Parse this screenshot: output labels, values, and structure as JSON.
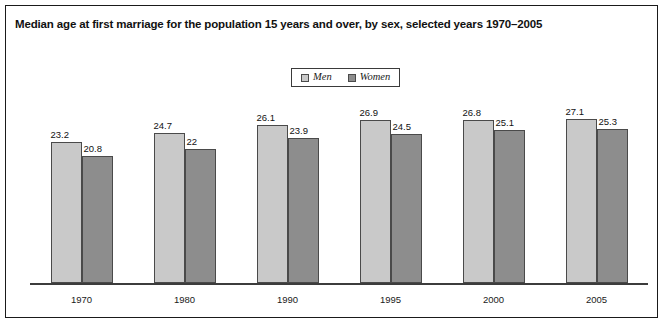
{
  "chart_data": {
    "type": "bar",
    "title": "Median age at first marriage for the population 15 years and over, by sex, selected years 1970–2005",
    "xlabel": "",
    "ylabel": "",
    "categories": [
      "1970",
      "1980",
      "1990",
      "1995",
      "2000",
      "2005"
    ],
    "series": [
      {
        "name": "Men",
        "color": "#c9c9c9",
        "values": [
          23.2,
          24.7,
          26.1,
          26.9,
          26.8,
          27.1
        ],
        "labels": [
          "23.2",
          "24.7",
          "26.1",
          "26.9",
          "26.8",
          "27.1"
        ]
      },
      {
        "name": "Women",
        "color": "#8d8d8d",
        "values": [
          20.8,
          22,
          23.9,
          24.5,
          25.1,
          25.3
        ],
        "labels": [
          "20.8",
          "22",
          "23.9",
          "24.5",
          "25.1",
          "25.3"
        ]
      }
    ],
    "ylim": [
      0,
      31
    ],
    "grid": false,
    "legend_position": "top-center",
    "value_labels_shown": true
  },
  "legend": {
    "entries": [
      {
        "label": "Men",
        "swatch": "#c9c9c9"
      },
      {
        "label": "Women",
        "swatch": "#8d8d8d"
      }
    ]
  },
  "axis": {
    "ticks": [
      "1970",
      "1980",
      "1990",
      "1995",
      "2000",
      "2005"
    ]
  }
}
